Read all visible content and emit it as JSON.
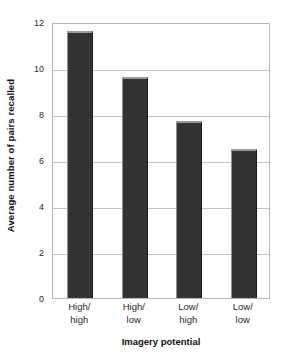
{
  "chart_data": {
    "type": "bar",
    "title": "",
    "categories": [
      "High/\nhigh",
      "High/\nlow",
      "Low/\nhigh",
      "Low/\nlow"
    ],
    "category_lines": [
      [
        "High/",
        "high"
      ],
      [
        "High/",
        "low"
      ],
      [
        "Low/",
        "high"
      ],
      [
        "Low/",
        "low"
      ]
    ],
    "values": [
      11.6,
      9.6,
      7.7,
      6.5
    ],
    "xlabel": "Imagery potential",
    "ylabel": "Average number of pairs recalled",
    "ylim": [
      0,
      12
    ],
    "ytick_labels": [
      "0",
      "2",
      "4",
      "6",
      "8",
      "10",
      "12"
    ],
    "ytick_values": [
      0,
      2,
      4,
      6,
      8,
      10,
      12
    ],
    "grid": "horizontal",
    "legend": "none",
    "bar_color": "#333333",
    "gridline_color": "#c4c4c4",
    "frame_color": "#b9b9b9",
    "background_color": "#ffffff"
  }
}
